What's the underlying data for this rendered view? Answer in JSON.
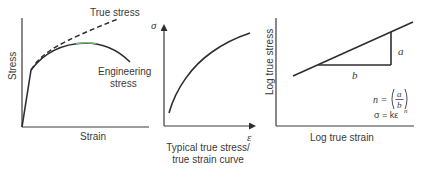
{
  "panels": {
    "engineering_vs_true": {
      "y_axis_label": "Stress",
      "x_axis_label": "Strain",
      "true_curve_label": "True stress",
      "engineering_curve_label_line1": "Engineering",
      "engineering_curve_label_line2": "stress"
    },
    "true_stress_strain": {
      "y_axis_symbol": "σ",
      "x_axis_symbol": "ε",
      "caption_line1": "Typical true stress/",
      "caption_line2": "true strain curve"
    },
    "log_log": {
      "y_axis_label": "Log true stress",
      "x_axis_label": "Log true strain",
      "rise_label": "a",
      "run_label": "b",
      "formula_n_lhs": "n =",
      "formula_n_num": "a",
      "formula_n_den": "b",
      "formula_power_law": "σ = kε",
      "formula_power_exp": "n"
    }
  },
  "colors": {
    "line": "#2e2e2e",
    "text": "#3a3a3a",
    "background": "#ffffff"
  }
}
